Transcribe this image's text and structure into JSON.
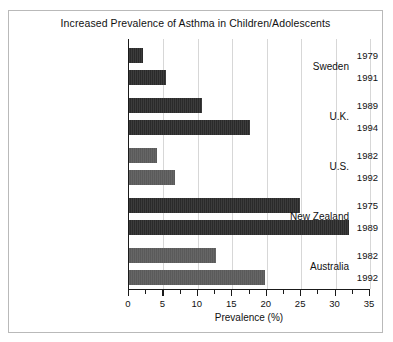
{
  "chart_data": {
    "type": "bar",
    "orientation": "horizontal",
    "title": "Increased Prevalence of Asthma in Children/Adolescents",
    "xlabel": "Prevalence (%)",
    "ylabel": "",
    "xlim": [
      0,
      35
    ],
    "xticks": [
      0,
      5,
      10,
      15,
      20,
      25,
      30,
      35
    ],
    "xtick_labels": [
      "0",
      "5",
      "10",
      "15",
      "20",
      "25",
      "30",
      "35"
    ],
    "minor_tick_interval": 2.5,
    "grid": "vertical",
    "legend": "none",
    "groups": [
      {
        "country": "Sweden",
        "color": "#2a2a2a",
        "bars": [
          {
            "year": "1979",
            "value": 2.0
          },
          {
            "year": "1991",
            "value": 5.4
          }
        ]
      },
      {
        "country": "U.K.",
        "color": "#2a2a2a",
        "bars": [
          {
            "year": "1989",
            "value": 10.6
          },
          {
            "year": "1994",
            "value": 17.5
          }
        ]
      },
      {
        "country": "U.S.",
        "color": "#5a5a5a",
        "bars": [
          {
            "year": "1982",
            "value": 4.0
          },
          {
            "year": "1992",
            "value": 6.7
          }
        ]
      },
      {
        "country": "New Zealand",
        "color": "#2a2a2a",
        "bars": [
          {
            "year": "1975",
            "value": 24.8
          },
          {
            "year": "1989",
            "value": 31.9
          }
        ]
      },
      {
        "country": "Australia",
        "color": "#5a5a5a",
        "bars": [
          {
            "year": "1982",
            "value": 12.6
          },
          {
            "year": "1992",
            "value": 19.8
          }
        ]
      }
    ]
  },
  "colors": {
    "dark_bar": "#2a2a2a",
    "gray_bar": "#5a5a5a",
    "gridline": "#d7d7d7",
    "axis": "#1a1a1a",
    "frame": "#b9b9b9",
    "background": "#ffffff"
  }
}
